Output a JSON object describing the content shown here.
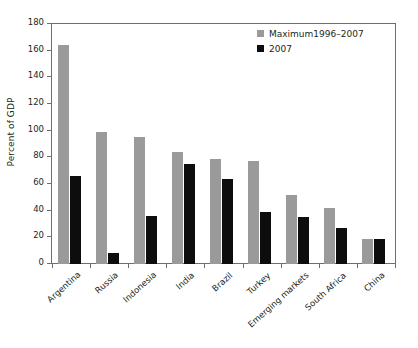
{
  "chart_data": {
    "type": "bar",
    "title": "",
    "subtitle": "",
    "xlabel": "",
    "ylabel": "Percent of GDP",
    "ylim": [
      0,
      180
    ],
    "yticks": [
      0,
      20,
      40,
      60,
      80,
      100,
      120,
      140,
      160,
      180
    ],
    "ytick_labels": [
      "0",
      "20",
      "40",
      "60",
      "80",
      "100",
      "120",
      "140",
      "160",
      "180"
    ],
    "grid": false,
    "legend_position": "top-right",
    "categories": [
      "Argentina",
      "Russia",
      "Indonesia",
      "India",
      "Brazil",
      "Turkey",
      "Emerging markets",
      "South Africa",
      "China"
    ],
    "series": [
      {
        "name": "Maximum1996–2007",
        "color": "#9a9a9a",
        "values": [
          164,
          99,
          95,
          84,
          79,
          77,
          52,
          42,
          19
        ]
      },
      {
        "name": "2007",
        "color": "#0d0d0d",
        "values": [
          66,
          8,
          36,
          75,
          64,
          39,
          35,
          27,
          19
        ]
      }
    ],
    "annotations": []
  },
  "legend": {
    "items": [
      {
        "label": "Maximum1996–2007",
        "swatch": "gray-swatch"
      },
      {
        "label": "2007",
        "swatch": "black-swatch"
      }
    ]
  },
  "axes": {
    "y_title": "Percent of GDP"
  }
}
